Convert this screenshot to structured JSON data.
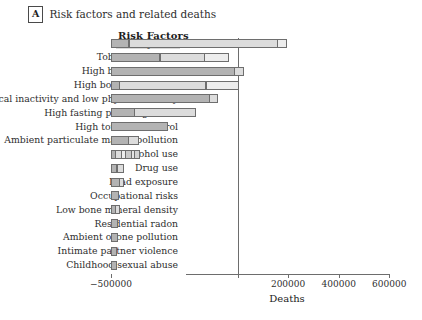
{
  "panel": {
    "letter": "A",
    "caption": "Risk factors and related deaths"
  },
  "chart_data": {
    "type": "bar",
    "orientation": "horizontal",
    "stacked": true,
    "title": "Risk factors and related deaths",
    "ylabel": "Risk Factors",
    "xlabel": "Deaths",
    "xlim": [
      -500000,
      850000
    ],
    "xticks": [
      -500000,
      0,
      200000,
      400000,
      600000,
      800000
    ],
    "xticklabels": [
      "−500000",
      "0",
      "200000",
      "400000",
      "600000",
      "800000"
    ],
    "grid": false,
    "legend": "none",
    "highlighted_category": "Dietary risks",
    "categories": [
      "Dietary risks",
      "Tobacco smoking",
      "High blood pressure",
      "High body mass index",
      "Physical inactivity and low physical activity",
      "High fasting plasma glucose",
      "High total cholesterol",
      "Ambient particulate matter pollution",
      "Alcohol use",
      "Drug use",
      "Lead exposure",
      "Occupational risks",
      "Low bone mineral density",
      "Residential radon",
      "Ambient ozone pollution",
      "Intimate partner violence",
      "Childhood sexual abuse"
    ],
    "values": [
      660000,
      470000,
      430000,
      375000,
      248000,
      212000,
      180000,
      150000,
      140000,
      65000,
      50000,
      33000,
      30000,
      22000,
      20000,
      12000,
      9000
    ],
    "segments": [
      [
        -500000,
        73000,
        590000,
        40000
      ],
      [
        -500000,
        195000,
        180000,
        95000
      ],
      [
        -500000,
        490000,
        40000
      ],
      [
        -500000,
        35000,
        345000,
        130000
      ],
      [
        -500000,
        390000,
        35000
      ],
      [
        -500000,
        95000,
        245000
      ],
      [
        -500000,
        225000
      ],
      [
        -500000,
        70000,
        45000
      ],
      [
        -500000,
        20000,
        25000,
        20000,
        25000,
        15000,
        25000
      ],
      [
        -500000,
        25000,
        30000
      ],
      [
        -500000,
        35000,
        20000
      ],
      [
        -500000,
        30000
      ],
      [
        -500000,
        20000,
        18000
      ],
      [
        -500000,
        28000
      ],
      [
        -500000,
        26000
      ],
      [
        -500000,
        24000
      ],
      [
        -500000,
        25000
      ]
    ]
  },
  "axis": {
    "y_title": "Risk Factors",
    "x_title": "Deaths",
    "tick_labels": [
      "−500000",
      "0",
      "200000",
      "400000",
      "600000",
      "800000"
    ]
  }
}
